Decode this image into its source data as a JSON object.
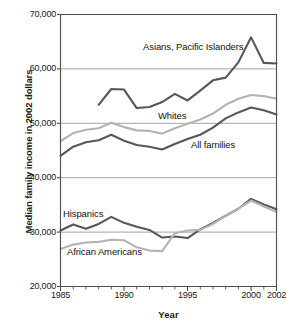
{
  "chart_data": {
    "type": "line",
    "title": "",
    "xlabel": "Year",
    "ylabel": "Median family income in 2002 dollars",
    "xlim": [
      1985,
      2002
    ],
    "ylim": [
      20000,
      70000
    ],
    "ytick_labels": [
      "20,000",
      "30,000",
      "40,000",
      "50,000",
      "60,000",
      "70,000"
    ],
    "ytick_values": [
      20000,
      30000,
      40000,
      50000,
      60000,
      70000
    ],
    "xtick_labels": [
      "1985",
      "1990",
      "1995",
      "2000",
      "2002"
    ],
    "xtick_values": [
      1985,
      1990,
      1995,
      2000,
      2002
    ],
    "minor_xticks_every": 1,
    "grid": "horizontal",
    "legend": "inline-annotations",
    "colors": {
      "dark_series": "#575757",
      "light_series": "#b4b4b4",
      "gridline": "#9a9a9a",
      "axis": "#4d4d4d",
      "text": "#111111"
    },
    "series": [
      {
        "name": "Asians, Pacific Islanders",
        "color": "#575757",
        "x": [
          1988,
          1989,
          1990,
          1991,
          1992,
          1993,
          1994,
          1995,
          1996,
          1997,
          1998,
          1999,
          2000,
          2001,
          2002
        ],
        "values": [
          53400,
          56300,
          56200,
          52800,
          53000,
          53900,
          55400,
          54200,
          56000,
          57900,
          58400,
          61200,
          65800,
          61100,
          61000
        ]
      },
      {
        "name": "Whites",
        "color": "#b4b4b4",
        "x": [
          1985,
          1986,
          1987,
          1988,
          1989,
          1990,
          1991,
          1992,
          1993,
          1994,
          1995,
          1996,
          1997,
          1998,
          1999,
          2000,
          2001,
          2002
        ],
        "values": [
          46700,
          48200,
          48800,
          49100,
          50100,
          49300,
          48700,
          48600,
          48100,
          49100,
          49900,
          50700,
          51800,
          53400,
          54500,
          55200,
          55000,
          54500
        ]
      },
      {
        "name": "All families",
        "color": "#575757",
        "x": [
          1985,
          1986,
          1987,
          1988,
          1989,
          1990,
          1991,
          1992,
          1993,
          1994,
          1995,
          1996,
          1997,
          1998,
          1999,
          2000,
          2001,
          2002
        ],
        "values": [
          44000,
          45700,
          46500,
          46900,
          47900,
          46800,
          46000,
          45700,
          45200,
          46200,
          47100,
          47900,
          49200,
          50900,
          52000,
          52900,
          52400,
          51600
        ]
      },
      {
        "name": "Hispanics",
        "color": "#575757",
        "x": [
          1985,
          1986,
          1987,
          1988,
          1989,
          1990,
          1991,
          1992,
          1993,
          1994,
          1995,
          1996,
          1997,
          1998,
          1999,
          2000,
          2001,
          2002
        ],
        "values": [
          30300,
          31400,
          30600,
          31500,
          32800,
          31700,
          31000,
          30400,
          29000,
          29200,
          28900,
          30500,
          31700,
          33000,
          34300,
          36100,
          35100,
          34200
        ]
      },
      {
        "name": "African Americans",
        "color": "#b4b4b4",
        "x": [
          1985,
          1986,
          1987,
          1988,
          1989,
          1990,
          1991,
          1992,
          1993,
          1994,
          1995,
          1996,
          1997,
          1998,
          1999,
          2000,
          2001,
          2002
        ],
        "values": [
          26900,
          27700,
          28100,
          28200,
          28600,
          28500,
          27200,
          26600,
          26500,
          29800,
          30300,
          30400,
          31500,
          33000,
          34300,
          35800,
          34700,
          33700
        ]
      }
    ],
    "annotations": [
      {
        "text": "Asians, Pacific Islanders",
        "x_px": 143,
        "y_px": 42
      },
      {
        "text": "Whites",
        "x_px": 158,
        "y_px": 111
      },
      {
        "text": "All families",
        "x_px": 191,
        "y_px": 140
      },
      {
        "text": "Hispanics",
        "x_px": 63,
        "y_px": 209
      },
      {
        "text": "African Americans",
        "x_px": 67,
        "y_px": 247
      }
    ]
  }
}
